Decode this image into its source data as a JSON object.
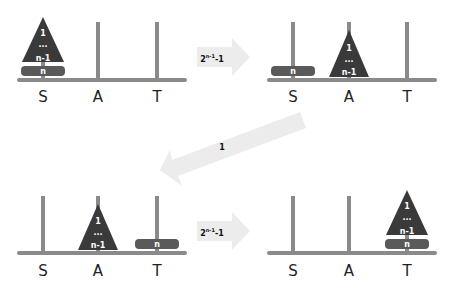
{
  "diagram": {
    "colors": {
      "peg": "#8a8a8a",
      "stack": "#3a3a3a",
      "disk": "#5a5a5a",
      "arrow": "#ececec"
    },
    "peg_labels": {
      "source": "S",
      "auxiliary": "A",
      "target": "T"
    },
    "stack_labels": {
      "top": "1",
      "middle": "...",
      "bottom": "n-1"
    },
    "disk_label": "n",
    "arrows": [
      {
        "base": "2",
        "exp": "n-1",
        "suffix": "-1"
      },
      {
        "text": "1"
      },
      {
        "base": "2",
        "exp": "n-1",
        "suffix": "-1"
      }
    ],
    "panels": [
      {
        "name": "initial",
        "stack_on": "S",
        "disk_on": "S"
      },
      {
        "name": "after-step-1",
        "stack_on": "A",
        "disk_on": "S"
      },
      {
        "name": "after-step-2",
        "stack_on": "A",
        "disk_on": "T"
      },
      {
        "name": "final",
        "stack_on": "T",
        "disk_on": "T"
      }
    ]
  }
}
